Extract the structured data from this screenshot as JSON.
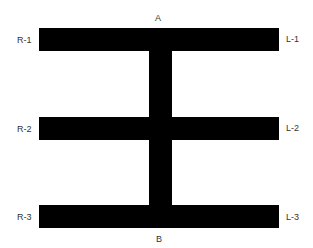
{
  "diagram": {
    "labels": {
      "top": "A",
      "bottom": "B",
      "right_side": [
        "R-1",
        "R-2",
        "R-3"
      ],
      "left_side": [
        "L-1",
        "L-2",
        "L-3"
      ]
    },
    "fill_color": "#000000",
    "background_color": "#ffffff"
  }
}
